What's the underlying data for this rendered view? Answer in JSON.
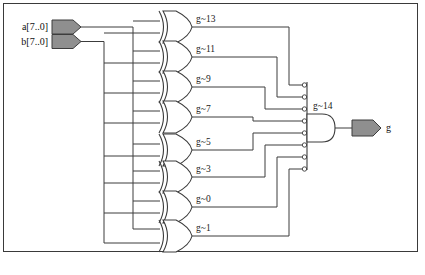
{
  "diagram": {
    "type": "logic-schematic",
    "frame": {
      "x": 3,
      "y": 3,
      "width": 415,
      "height": 249
    },
    "colors": {
      "wire": "#3c3c3c",
      "gate_outline": "#3c3c3c",
      "port_fill": "#8f8f8f",
      "background": "#ffffff",
      "border": "#3a3a3a",
      "text": "#1a1a1a"
    },
    "inputs": [
      {
        "label": "a[7..0]",
        "name": "input-port-a",
        "x": 52,
        "y": 27,
        "bus_x": 133
      },
      {
        "label": "b[7..0]",
        "name": "input-port-b",
        "x": 52,
        "y": 41,
        "bus_x": 104
      }
    ],
    "outputs": [
      {
        "label": "g",
        "name": "output-port-g",
        "x": 381,
        "y": 128
      }
    ],
    "xor_gates": [
      {
        "label": "g~13",
        "name": "xor-gate-g13",
        "cy": 27,
        "label_x": 196,
        "label_y": 22,
        "and_input_index": 0
      },
      {
        "label": "g~11",
        "name": "xor-gate-g11",
        "cy": 57,
        "label_x": 196,
        "label_y": 52,
        "and_input_index": 1
      },
      {
        "label": "g~9",
        "name": "xor-gate-g9",
        "cy": 87,
        "label_x": 196,
        "label_y": 82,
        "and_input_index": 2
      },
      {
        "label": "g~7",
        "name": "xor-gate-g7",
        "cy": 117,
        "label_x": 196,
        "label_y": 112,
        "and_input_index": 3
      },
      {
        "label": "g~5",
        "name": "xor-gate-g5",
        "cy": 150,
        "label_x": 196,
        "label_y": 145,
        "and_input_index": 4
      },
      {
        "label": "g~3",
        "name": "xor-gate-g3",
        "cy": 177,
        "label_x": 196,
        "label_y": 172,
        "and_input_index": 5
      },
      {
        "label": "g~0",
        "name": "xor-gate-g0",
        "cy": 207,
        "label_x": 196,
        "label_y": 202,
        "and_input_index": 6
      },
      {
        "label": "g~1",
        "name": "xor-gate-g1",
        "cy": 236,
        "label_x": 196,
        "label_y": 231,
        "and_input_index": 7
      }
    ],
    "and_gate": {
      "label": "g~14",
      "name": "and-gate-g14",
      "label_x": 316,
      "label_y": 109,
      "bus_x": 307,
      "bus_top": 82,
      "bus_bottom": 170,
      "body_x": 310,
      "cy": 128,
      "inverted_inputs": true,
      "input_count": 8
    }
  }
}
